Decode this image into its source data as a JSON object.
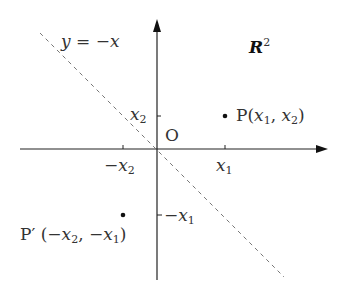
{
  "diagram": {
    "space_label": {
      "base": "R",
      "exp": "2"
    },
    "line_label": "y = −x",
    "origin_label": "O",
    "ticks": {
      "x_pos": {
        "var": "x",
        "sub": "1"
      },
      "x_neg": {
        "sign": "−",
        "var": "x",
        "sub": "2"
      },
      "y_pos": {
        "var": "x",
        "sub": "2"
      },
      "y_neg": {
        "sign": "−",
        "var": "x",
        "sub": "1"
      }
    },
    "point_P": {
      "name": "P",
      "open": "(",
      "a_var": "x",
      "a_sub": "1",
      "sep": ", ",
      "b_var": "x",
      "b_sub": "2",
      "close": ")"
    },
    "point_P_prime": {
      "name": "P′",
      "open": " (",
      "a_sign": "−",
      "a_var": "x",
      "a_sub": "2",
      "sep": ", ",
      "b_sign": "−",
      "b_var": "x",
      "b_sub": "1",
      "close": ")"
    },
    "colors": {
      "axis": "#222222",
      "dashed_line": "#777777",
      "text": "#333333"
    }
  }
}
